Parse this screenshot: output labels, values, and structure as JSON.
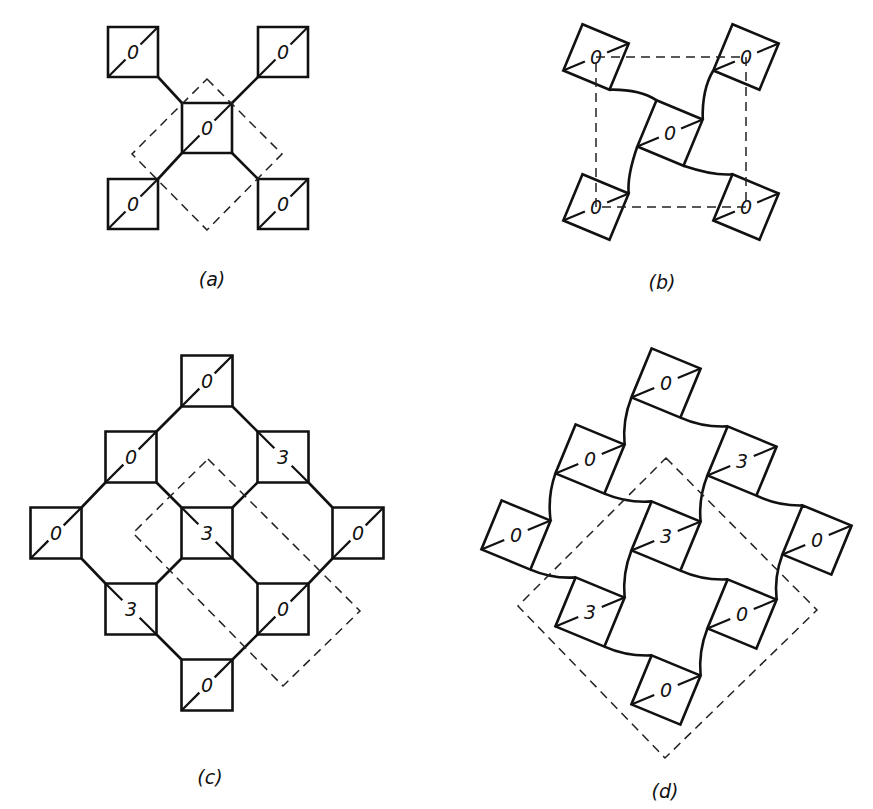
{
  "figure": {
    "panels": [
      {
        "id": "a",
        "caption": "(a)",
        "caption_pos": [
          212,
          279
        ],
        "squares": [
          {
            "label": "0",
            "c": [
              133,
              52
            ]
          },
          {
            "label": "0",
            "c": [
              283,
              52
            ]
          },
          {
            "label": "0",
            "c": [
              207,
              128
            ]
          },
          {
            "label": "0",
            "c": [
              133,
              204
            ]
          },
          {
            "label": "0",
            "c": [
              283,
              204
            ]
          }
        ],
        "cell_outline": [
          [
            207,
            79
          ],
          [
            282,
            154
          ],
          [
            207,
            230
          ],
          [
            132,
            154
          ]
        ]
      },
      {
        "id": "b",
        "caption": "(b)",
        "caption_pos": [
          662,
          282
        ],
        "squares": [
          {
            "label": "0",
            "c": [
              596,
              57
            ]
          },
          {
            "label": "0",
            "c": [
              746,
              57
            ]
          },
          {
            "label": "0",
            "c": [
              670,
              133
            ]
          },
          {
            "label": "0",
            "c": [
              596,
              207
            ]
          },
          {
            "label": "0",
            "c": [
              746,
              207
            ]
          }
        ],
        "cell_outline": [
          [
            596,
            57
          ],
          [
            746,
            57
          ],
          [
            746,
            207
          ],
          [
            596,
            207
          ]
        ]
      },
      {
        "id": "c",
        "caption": "(c)",
        "caption_pos": [
          210,
          777
        ],
        "squares": [
          {
            "label": "0",
            "c": [
              207,
              381
            ]
          },
          {
            "label": "0",
            "c": [
              131,
              457
            ]
          },
          {
            "label": "3",
            "c": [
              283,
              457
            ]
          },
          {
            "label": "0",
            "c": [
              56,
              533
            ]
          },
          {
            "label": "3",
            "c": [
              207,
              533
            ]
          },
          {
            "label": "0",
            "c": [
              358,
              533
            ]
          },
          {
            "label": "3",
            "c": [
              131,
              609
            ]
          },
          {
            "label": "0",
            "c": [
              283,
              609
            ]
          },
          {
            "label": "0",
            "c": [
              207,
              685
            ]
          }
        ],
        "cell_outline": [
          [
            208,
            459
          ],
          [
            360,
            611
          ],
          [
            283,
            686
          ],
          [
            133,
            533
          ]
        ]
      },
      {
        "id": "d",
        "caption": "(d)",
        "caption_pos": [
          665,
          791
        ],
        "squares": [
          {
            "label": "0",
            "c": [
              666,
              383
            ]
          },
          {
            "label": "0",
            "c": [
              590,
              459
            ]
          },
          {
            "label": "3",
            "c": [
              742,
              461
            ]
          },
          {
            "label": "0",
            "c": [
              516,
              535
            ]
          },
          {
            "label": "3",
            "c": [
              666,
              536
            ]
          },
          {
            "label": "0",
            "c": [
              817,
              540
            ]
          },
          {
            "label": "3",
            "c": [
              590,
              612
            ]
          },
          {
            "label": "0",
            "c": [
              742,
              614
            ]
          },
          {
            "label": "0",
            "c": [
              666,
              690
            ]
          }
        ],
        "cell_outline": [
          [
            666,
            458
          ],
          [
            817,
            610
          ],
          [
            665,
            758
          ],
          [
            518,
            606
          ]
        ]
      }
    ]
  }
}
